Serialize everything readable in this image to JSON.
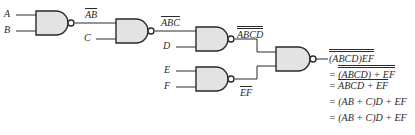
{
  "inputs": {
    "a": "A",
    "b": "B",
    "c": "C",
    "d": "D",
    "e": "E",
    "f": "F"
  },
  "intermediate": {
    "gate1_out": "AB",
    "gate2_out": "ABC",
    "gate3_out": "ABCD",
    "gate4_out": "EF"
  },
  "output_expression": {
    "line1": {
      "prefix": "",
      "body": "(ABCD)EF"
    },
    "line2": {
      "prefix": "= ",
      "body": "(ABCD) + EF"
    },
    "line3": {
      "prefix": "= ",
      "body": "ABCD + EF"
    },
    "line4": {
      "prefix": "= ",
      "body": "(AB + C)D + EF"
    },
    "line5": {
      "prefix": "= ",
      "body": "(AB + C)D + EF"
    }
  },
  "colors": {
    "gate_fill": "#e3e3e3",
    "stroke": "#2a2a2a"
  }
}
